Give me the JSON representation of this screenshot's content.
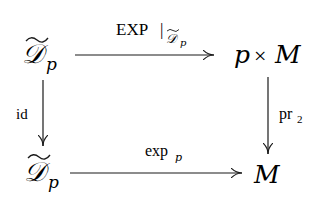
{
  "diagram": {
    "type": "commutative-square",
    "nodes": {
      "top_left": {
        "main": "𝒟",
        "sub": "p",
        "tilde": true,
        "label": "D̃_p"
      },
      "top_right": {
        "p": "p",
        "times": "×",
        "M": "M",
        "label": "p × M"
      },
      "bottom_left": {
        "main": "𝒟",
        "sub": "p",
        "tilde": true,
        "label": "D̃_p"
      },
      "bottom_right": {
        "M": "M",
        "label": "M"
      }
    },
    "arrows": {
      "top": {
        "label": "EXP",
        "restriction_bar": "|",
        "restriction_main": "𝒟",
        "restriction_sub": "p",
        "from": "D̃_p",
        "to": "p × M"
      },
      "left": {
        "label": "id",
        "from": "D̃_p",
        "to": "D̃_p"
      },
      "right": {
        "label": "pr",
        "sub": "2",
        "from": "p × M",
        "to": "M"
      },
      "bottom": {
        "label": "exp",
        "sub": "p",
        "from": "D̃_p",
        "to": "M"
      }
    }
  }
}
